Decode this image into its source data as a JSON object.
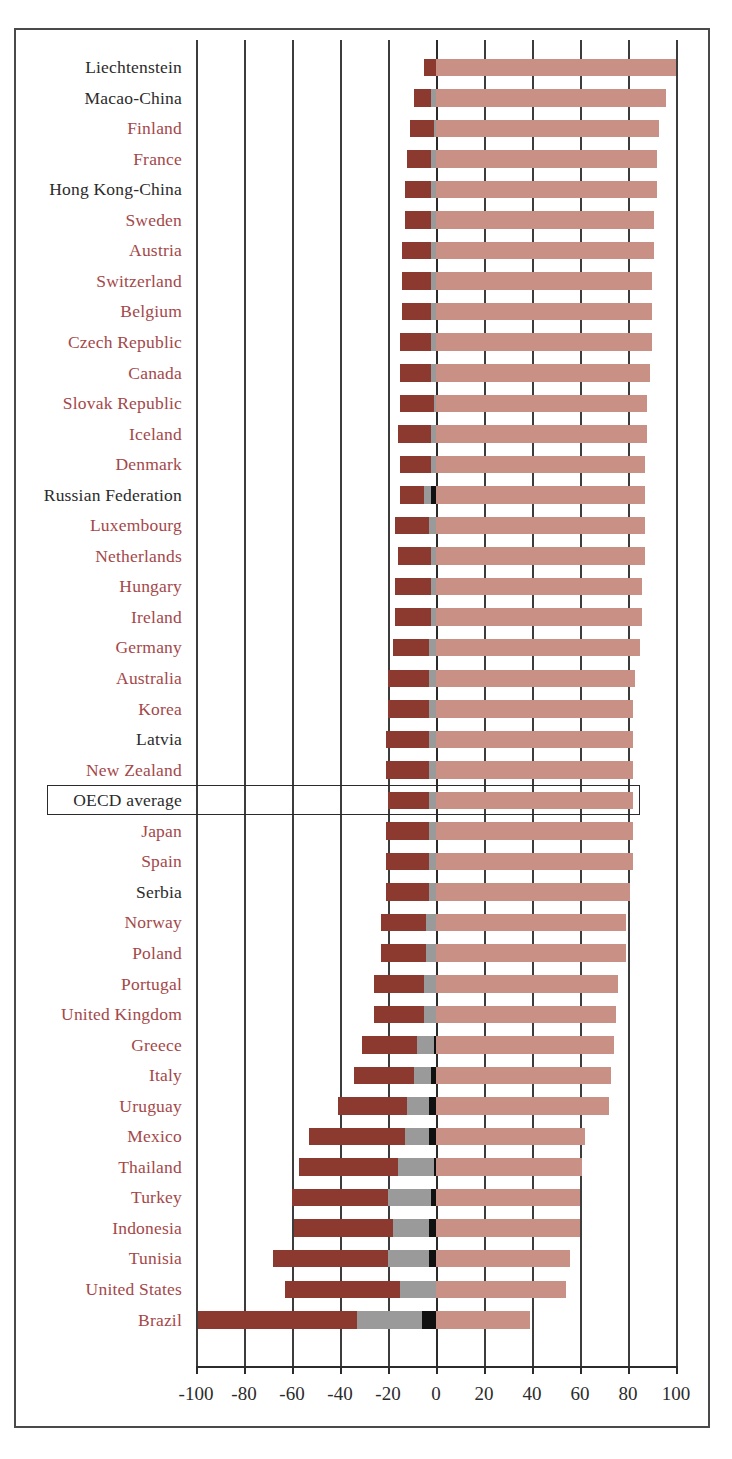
{
  "chart_data": {
    "type": "bar",
    "orientation": "horizontal",
    "stacked": true,
    "title": "",
    "xlabel": "",
    "ylabel": "",
    "xlim": [
      -100,
      100
    ],
    "xticks": [
      -100,
      -80,
      -60,
      -40,
      -20,
      0,
      20,
      40,
      60,
      80,
      100
    ],
    "xtick_labels": [
      "-100",
      "-80",
      "-60",
      "-40",
      "-20",
      "0",
      "20",
      "40",
      "60",
      "80",
      "100"
    ],
    "grid": true,
    "legend": "none",
    "colors": {
      "neg1": "#8c3a2f",
      "neg2": "#9a9a9a",
      "neg3": "#111111",
      "pos": "#c99086",
      "label_red": "#a4484a",
      "label_dark": "#2b2b2b",
      "axis": "#2b2b2b",
      "frame": "#4a4a4a"
    },
    "series": [
      {
        "name": "neg1",
        "color": "#8c3a2f"
      },
      {
        "name": "neg2",
        "color": "#9a9a9a"
      },
      {
        "name": "neg3",
        "color": "#111111"
      },
      {
        "name": "pos",
        "color": "#c99086"
      }
    ],
    "categories": [
      "Liechtenstein",
      "Macao-China",
      "Finland",
      "France",
      "Hong Kong-China",
      "Sweden",
      "Austria",
      "Switzerland",
      "Belgium",
      "Czech Republic",
      "Canada",
      "Slovak Republic",
      "Iceland",
      "Denmark",
      "Russian Federation",
      "Luxembourg",
      "Netherlands",
      "Hungary",
      "Ireland",
      "Germany",
      "Australia",
      "Korea",
      "Latvia",
      "New Zealand",
      "OECD average",
      "Japan",
      "Spain",
      "Serbia",
      "Norway",
      "Poland",
      "Portugal",
      "United Kingdom",
      "Greece",
      "Italy",
      "Uruguay",
      "Mexico",
      "Thailand",
      "Turkey",
      "Indonesia",
      "Tunisia",
      "United States",
      "Brazil"
    ],
    "rows": [
      {
        "label": "Liechtenstein",
        "label_color": "dark",
        "neg1": -5,
        "neg2": 0,
        "neg3": 0,
        "pos": 100
      },
      {
        "label": "Macao-China",
        "label_color": "dark",
        "neg1": -7,
        "neg2": -2,
        "neg3": 0,
        "pos": 96
      },
      {
        "label": "Finland",
        "label_color": "red",
        "neg1": -10,
        "neg2": -1,
        "neg3": 0,
        "pos": 93
      },
      {
        "label": "France",
        "label_color": "red",
        "neg1": -10,
        "neg2": -2,
        "neg3": 0,
        "pos": 92
      },
      {
        "label": "Hong Kong-China",
        "label_color": "dark",
        "neg1": -11,
        "neg2": -2,
        "neg3": 0,
        "pos": 92
      },
      {
        "label": "Sweden",
        "label_color": "red",
        "neg1": -11,
        "neg2": -2,
        "neg3": 0,
        "pos": 91
      },
      {
        "label": "Austria",
        "label_color": "red",
        "neg1": -12,
        "neg2": -2,
        "neg3": 0,
        "pos": 91
      },
      {
        "label": "Switzerland",
        "label_color": "red",
        "neg1": -12,
        "neg2": -2,
        "neg3": 0,
        "pos": 90
      },
      {
        "label": "Belgium",
        "label_color": "red",
        "neg1": -12,
        "neg2": -2,
        "neg3": 0,
        "pos": 90
      },
      {
        "label": "Czech Republic",
        "label_color": "red",
        "neg1": -13,
        "neg2": -2,
        "neg3": 0,
        "pos": 90
      },
      {
        "label": "Canada",
        "label_color": "red",
        "neg1": -13,
        "neg2": -2,
        "neg3": 0,
        "pos": 89
      },
      {
        "label": "Slovak Republic",
        "label_color": "red",
        "neg1": -14,
        "neg2": -1,
        "neg3": 0,
        "pos": 88
      },
      {
        "label": "Iceland",
        "label_color": "red",
        "neg1": -14,
        "neg2": -2,
        "neg3": 0,
        "pos": 88
      },
      {
        "label": "Denmark",
        "label_color": "red",
        "neg1": -13,
        "neg2": -2,
        "neg3": 0,
        "pos": 87
      },
      {
        "label": "Russian Federation",
        "label_color": "dark",
        "neg1": -10,
        "neg2": -3,
        "neg3": -2,
        "pos": 87
      },
      {
        "label": "Luxembourg",
        "label_color": "red",
        "neg1": -14,
        "neg2": -3,
        "neg3": 0,
        "pos": 87
      },
      {
        "label": "Netherlands",
        "label_color": "red",
        "neg1": -14,
        "neg2": -2,
        "neg3": 0,
        "pos": 87
      },
      {
        "label": "Hungary",
        "label_color": "red",
        "neg1": -15,
        "neg2": -2,
        "neg3": 0,
        "pos": 86
      },
      {
        "label": "Ireland",
        "label_color": "red",
        "neg1": -15,
        "neg2": -2,
        "neg3": 0,
        "pos": 86
      },
      {
        "label": "Germany",
        "label_color": "red",
        "neg1": -15,
        "neg2": -3,
        "neg3": 0,
        "pos": 85
      },
      {
        "label": "Australia",
        "label_color": "red",
        "neg1": -17,
        "neg2": -3,
        "neg3": 0,
        "pos": 83
      },
      {
        "label": "Korea",
        "label_color": "red",
        "neg1": -17,
        "neg2": -3,
        "neg3": 0,
        "pos": 82
      },
      {
        "label": "Latvia",
        "label_color": "dark",
        "neg1": -18,
        "neg2": -3,
        "neg3": 0,
        "pos": 82
      },
      {
        "label": "New Zealand",
        "label_color": "red",
        "neg1": -18,
        "neg2": -3,
        "neg3": 0,
        "pos": 82
      },
      {
        "label": "OECD average",
        "label_color": "dark",
        "neg1": -17,
        "neg2": -3,
        "neg3": 0,
        "pos": 82
      },
      {
        "label": "Japan",
        "label_color": "red",
        "neg1": -18,
        "neg2": -3,
        "neg3": 0,
        "pos": 82
      },
      {
        "label": "Spain",
        "label_color": "red",
        "neg1": -18,
        "neg2": -3,
        "neg3": 0,
        "pos": 82
      },
      {
        "label": "Serbia",
        "label_color": "dark",
        "neg1": -18,
        "neg2": -3,
        "neg3": 0,
        "pos": 81
      },
      {
        "label": "Norway",
        "label_color": "red",
        "neg1": -19,
        "neg2": -4,
        "neg3": 0,
        "pos": 79
      },
      {
        "label": "Poland",
        "label_color": "red",
        "neg1": -19,
        "neg2": -4,
        "neg3": 0,
        "pos": 79
      },
      {
        "label": "Portugal",
        "label_color": "red",
        "neg1": -21,
        "neg2": -5,
        "neg3": 0,
        "pos": 76
      },
      {
        "label": "United Kingdom",
        "label_color": "red",
        "neg1": -21,
        "neg2": -5,
        "neg3": 0,
        "pos": 75
      },
      {
        "label": "Greece",
        "label_color": "red",
        "neg1": -23,
        "neg2": -7,
        "neg3": -1,
        "pos": 74
      },
      {
        "label": "Italy",
        "label_color": "red",
        "neg1": -25,
        "neg2": -7,
        "neg3": -2,
        "pos": 73
      },
      {
        "label": "Uruguay",
        "label_color": "red",
        "neg1": -29,
        "neg2": -9,
        "neg3": -3,
        "pos": 72
      },
      {
        "label": "Mexico",
        "label_color": "red",
        "neg1": -40,
        "neg2": -10,
        "neg3": -3,
        "pos": 62
      },
      {
        "label": "Thailand",
        "label_color": "red",
        "neg1": -41,
        "neg2": -15,
        "neg3": -1,
        "pos": 61
      },
      {
        "label": "Turkey",
        "label_color": "red",
        "neg1": -40,
        "neg2": -18,
        "neg3": -2,
        "pos": 60
      },
      {
        "label": "Indonesia",
        "label_color": "red",
        "neg1": -41,
        "neg2": -15,
        "neg3": -3,
        "pos": 60
      },
      {
        "label": "Tunisia",
        "label_color": "red",
        "neg1": -48,
        "neg2": -17,
        "neg3": -3,
        "pos": 56
      },
      {
        "label": "United States",
        "label_color": "red",
        "neg1": -48,
        "neg2": -15,
        "neg3": 0,
        "pos": 54
      },
      {
        "label": "Brazil",
        "label_color": "red",
        "neg1": -66,
        "neg2": -27,
        "neg3": -6,
        "pos": 39
      }
    ]
  }
}
